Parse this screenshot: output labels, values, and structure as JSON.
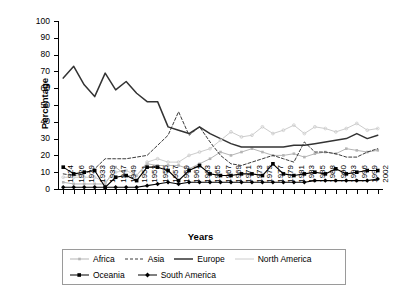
{
  "chart_data": {
    "type": "line",
    "title": "",
    "xlabel": "Years",
    "ylabel": "Percentage",
    "ylim": [
      0,
      100
    ],
    "ytick_step": 10,
    "yticks": [
      "0",
      "10",
      "20",
      "30",
      "40",
      "50",
      "60",
      "70",
      "80",
      "90",
      "100"
    ],
    "grid": false,
    "legend_position": "bottom",
    "categories": [
      "1924",
      "1926",
      "1929",
      "1933",
      "1939",
      "1947",
      "1949",
      "1951",
      "1953",
      "1955",
      "1957",
      "1959",
      "1961",
      "1963",
      "1965",
      "1967",
      "1969",
      "1971",
      "1973",
      "1975",
      "1977",
      "1979",
      "1981",
      "1983",
      "1985",
      "1988",
      "1990",
      "1993",
      "1996",
      "1999",
      "2002"
    ],
    "series": [
      {
        "name": "Africa",
        "color": "#b5b5b5",
        "style": "solid-marker",
        "values": [
          4,
          3,
          3,
          3,
          3,
          13,
          8,
          8,
          15,
          14,
          14,
          14,
          12,
          15,
          18,
          22,
          20,
          22,
          24,
          22,
          20,
          20,
          21,
          19,
          21,
          22,
          21,
          24,
          23,
          22,
          23
        ]
      },
      {
        "name": "Asia",
        "color": "#3b3b3b",
        "style": "dashed",
        "values": [
          9,
          8,
          9,
          12,
          18,
          18,
          18,
          19,
          20,
          26,
          32,
          46,
          32,
          37,
          28,
          20,
          15,
          14,
          16,
          18,
          20,
          18,
          16,
          28,
          22,
          22,
          21,
          19,
          19,
          22,
          24
        ]
      },
      {
        "name": "Europe",
        "color": "#333333",
        "style": "solid-thick",
        "values": [
          66,
          73,
          62,
          55,
          69,
          59,
          64,
          57,
          52,
          52,
          37,
          35,
          33,
          37,
          33,
          30,
          27,
          25,
          25,
          25,
          25,
          25,
          26,
          26,
          27,
          28,
          29,
          30,
          33,
          30,
          32
        ]
      },
      {
        "name": "North America",
        "color": "#cccccc",
        "style": "solid-light",
        "values": [
          7,
          7,
          7,
          7,
          4,
          10,
          11,
          8,
          16,
          18,
          16,
          16,
          20,
          22,
          24,
          29,
          34,
          31,
          32,
          37,
          33,
          35,
          38,
          33,
          37,
          36,
          34,
          36,
          39,
          35,
          36
        ]
      },
      {
        "name": "Oceania",
        "color": "#000000",
        "style": "solid-square",
        "values": [
          13,
          9,
          10,
          11,
          1,
          7,
          8,
          5,
          13,
          13,
          11,
          5,
          11,
          14,
          9,
          8,
          8,
          9,
          9,
          8,
          15,
          9,
          8,
          9,
          10,
          9,
          12,
          9,
          10,
          11,
          11
        ]
      },
      {
        "name": "South America",
        "color": "#000000",
        "style": "solid-diamond",
        "values": [
          1,
          1,
          1,
          1,
          1,
          1,
          1,
          1,
          2,
          3,
          4,
          3,
          4,
          4,
          4,
          4,
          4,
          4,
          4,
          4,
          4,
          4,
          4,
          4,
          5,
          5,
          5,
          5,
          5,
          5,
          6
        ]
      }
    ]
  },
  "legend": {
    "rows": [
      [
        "Africa",
        "Asia",
        "Europe",
        "North America"
      ],
      [
        "Oceania",
        "South America"
      ]
    ]
  }
}
